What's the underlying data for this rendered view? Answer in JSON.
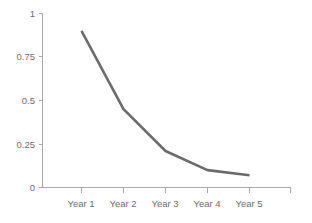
{
  "chart_data": {
    "type": "line",
    "title": "",
    "subtitle": "",
    "xlabel": "",
    "ylabel": "",
    "categories": [
      "Year 1",
      "Year 2",
      "Year 3",
      "Year 4",
      "Year 5"
    ],
    "series": [
      {
        "name": "",
        "values": [
          0.9,
          0.45,
          0.21,
          0.1,
          0.07
        ],
        "color": "#6b6b6b"
      }
    ],
    "ylim": [
      0,
      1
    ],
    "y_ticks": [
      0,
      0.25,
      0.5,
      0.75,
      1
    ],
    "y_tick_labels": [
      "0",
      "0.25",
      "0.5",
      "0.75",
      "1"
    ],
    "x_tick_labels": [
      "Year 1",
      "Year 2",
      "Year 3",
      "Year 4",
      "Year 5"
    ],
    "grid": false,
    "legend": false,
    "legend_position": "none",
    "annotations": []
  },
  "axes": {
    "y_axis_color": "#a8a8a8",
    "x_axis_color": "#a8a8a8",
    "tick_label_color": "#6d6d6d"
  },
  "background": {
    "color": "#ffffff"
  }
}
